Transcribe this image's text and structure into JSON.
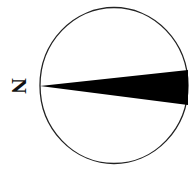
{
  "north_arrow": {
    "label": "N",
    "colors": {
      "outline": "#222222",
      "needle": "#000000",
      "background": "#ffffff"
    },
    "orientation": "rotated 90 degrees, north pointing left"
  }
}
